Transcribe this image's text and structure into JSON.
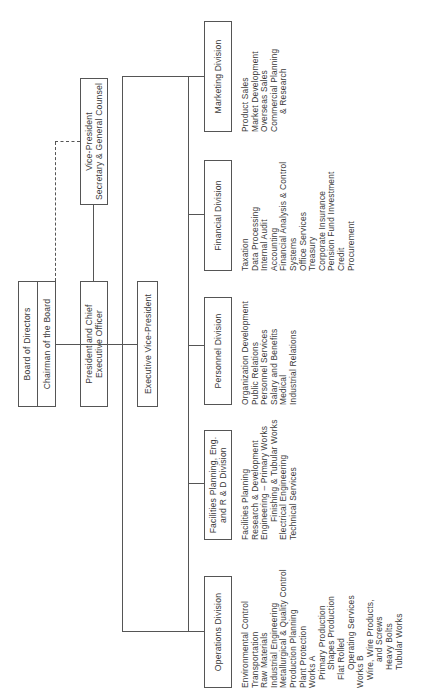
{
  "chart": {
    "orientation": "rotated-90-ccw",
    "top_level": {
      "board": {
        "line1": "Board of Directors",
        "line2": "Chairman of the Board"
      },
      "president": {
        "line1": "President and Chief",
        "line2": "Executive Officer"
      },
      "vp_secretary": {
        "line1": "Vice-President",
        "line2": "Secretary & General Counsel"
      },
      "exec_vp": {
        "label": "Executive Vice-President"
      }
    },
    "divisions": [
      {
        "name": "Operations Division",
        "items": [
          {
            "text": "Environmental Control",
            "indent": 0
          },
          {
            "text": "Transportation",
            "indent": 0
          },
          {
            "text": "Raw Materials",
            "indent": 0
          },
          {
            "text": "Industrial Engineering",
            "indent": 0
          },
          {
            "text": "Metallurgical & Quality Control",
            "indent": 0
          },
          {
            "text": "Production Planning",
            "indent": 0
          },
          {
            "text": "Plant Protection",
            "indent": 0
          },
          {
            "text": "Works A",
            "indent": 0
          },
          {
            "text": "Primary Production",
            "indent": 1
          },
          {
            "text": "Shapes Production",
            "indent": 2
          },
          {
            "text": "Flat Rolled",
            "indent": 1
          },
          {
            "text": "Operating Services",
            "indent": 2
          },
          {
            "text": "Works B",
            "indent": 0
          },
          {
            "text": "Wire, Wire Products,",
            "indent": 1
          },
          {
            "text": "and Screws",
            "indent": 3
          },
          {
            "text": "Heavy Bolts",
            "indent": 2
          },
          {
            "text": "Tubular Works",
            "indent": 2
          }
        ]
      },
      {
        "name_line1": "Facilities Planning, Eng.",
        "name_line2": "and R & D Division",
        "items": [
          {
            "text": "Facilities Planning",
            "indent": 0
          },
          {
            "text": "Research & Development",
            "indent": 0
          },
          {
            "text": "Engineering – Primary Works",
            "indent": 0
          },
          {
            "text": "Finishing & Tubular Works",
            "indent": 2
          },
          {
            "text": "Electrical Engineering",
            "indent": 0
          },
          {
            "text": "Technical Services",
            "indent": 0
          }
        ]
      },
      {
        "name": "Personnel Division",
        "items": [
          {
            "text": "Organization Development",
            "indent": 0
          },
          {
            "text": "Public Relations",
            "indent": 0
          },
          {
            "text": "Personnel Services",
            "indent": 0
          },
          {
            "text": "Salary and Benefits",
            "indent": 0
          },
          {
            "text": "Medical",
            "indent": 0
          },
          {
            "text": "Industrial Relations",
            "indent": 0
          }
        ]
      },
      {
        "name": "Financial Division",
        "items": [
          {
            "text": "Taxation",
            "indent": 0
          },
          {
            "text": "Data Processing",
            "indent": 0
          },
          {
            "text": "Internal Audit",
            "indent": 0
          },
          {
            "text": "Accounting",
            "indent": 0
          },
          {
            "text": "Financial Analysis & Control",
            "indent": 0
          },
          {
            "text": "Systems",
            "indent": 0
          },
          {
            "text": "Office Services",
            "indent": 0
          },
          {
            "text": "Treasury",
            "indent": 0
          },
          {
            "text": "Corporate Insurance",
            "indent": 0
          },
          {
            "text": "Pension Fund Investment",
            "indent": 0
          },
          {
            "text": "Credit",
            "indent": 0
          },
          {
            "text": "Procurement",
            "indent": 0
          }
        ]
      },
      {
        "name": "Marketing Division",
        "items": [
          {
            "text": "Product Sales",
            "indent": 0
          },
          {
            "text": "Market Development",
            "indent": 0
          },
          {
            "text": "Overseas Sales",
            "indent": 0
          },
          {
            "text": "Commercial Planning",
            "indent": 0
          },
          {
            "text": "& Research",
            "indent": 2
          }
        ]
      }
    ],
    "colors": {
      "line": "#555555",
      "text": "#3a3a3a",
      "background": "#ffffff"
    }
  }
}
